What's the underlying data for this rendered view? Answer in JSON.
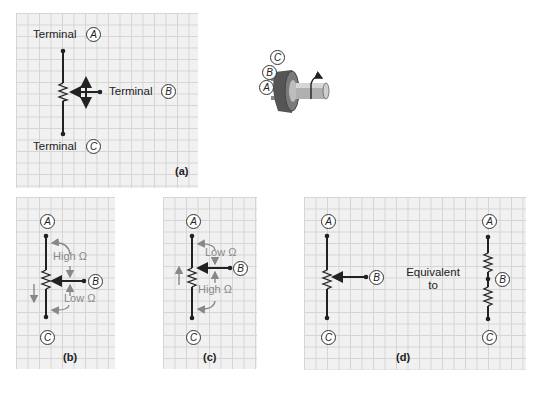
{
  "panel_a": {
    "terminal_a_label": "Terminal",
    "terminal_b_label": "Terminal",
    "terminal_c_label": "Terminal",
    "letter_a": "A",
    "letter_b": "B",
    "letter_c": "C",
    "caption": "(a)"
  },
  "knob": {
    "letter_a": "A",
    "letter_b": "B",
    "letter_c": "C"
  },
  "panel_b": {
    "letter_a": "A",
    "letter_b": "B",
    "letter_c": "C",
    "upper_label": "High Ω",
    "lower_label": "Low Ω",
    "caption": "(b)"
  },
  "panel_c": {
    "letter_a": "A",
    "letter_b": "B",
    "letter_c": "C",
    "upper_label": "Low Ω",
    "lower_label": "High Ω",
    "caption": "(c)"
  },
  "panel_d": {
    "left_letter_a": "A",
    "left_letter_b": "B",
    "left_letter_c": "C",
    "equivalent_line1": "Equivalent",
    "equivalent_line2": "to",
    "right_letter_a": "A",
    "right_letter_b": "B",
    "right_letter_c": "C",
    "caption": "(d)"
  },
  "colors": {
    "grid_bg": "#f1f1f1",
    "grid_line": "#d4d4d4",
    "ink": "#222222",
    "annotation": "#888888"
  }
}
